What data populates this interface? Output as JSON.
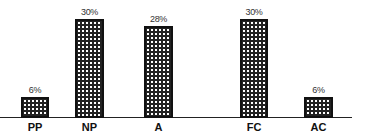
{
  "chart_data": {
    "type": "bar",
    "title": "",
    "xlabel": "",
    "ylabel": "",
    "categories": [
      "PP",
      "NP",
      "A",
      "FC",
      "AC"
    ],
    "values": [
      6,
      30,
      28,
      30,
      6
    ],
    "value_labels": [
      "6%",
      "30%",
      "28%",
      "30%",
      "6%"
    ],
    "unit": "%",
    "ylim": [
      0,
      32
    ],
    "grid": false,
    "legend": null,
    "bar_pattern": "crosshatch",
    "colors": {
      "bar_border": "#111111",
      "bar_fill": "#222222",
      "axis": "#222222",
      "background": "#ffffff"
    }
  },
  "layout": {
    "bars": [
      {
        "left": 21,
        "width": 28
      },
      {
        "left": 75,
        "width": 29
      },
      {
        "left": 144,
        "width": 29
      },
      {
        "left": 240,
        "width": 28
      },
      {
        "left": 304,
        "width": 29
      }
    ]
  }
}
